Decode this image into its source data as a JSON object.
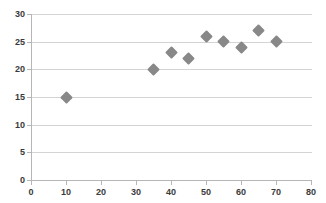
{
  "chart_data": {
    "type": "scatter",
    "title": "",
    "xlabel": "",
    "ylabel": "",
    "xlim": [
      0,
      80
    ],
    "ylim": [
      0,
      30
    ],
    "xticks": [
      0,
      10,
      20,
      30,
      40,
      50,
      60,
      70,
      80
    ],
    "yticks": [
      0,
      5,
      10,
      15,
      20,
      25,
      30
    ],
    "grid": "horizontal",
    "legend": "none",
    "marker": {
      "shape": "diamond",
      "color": "#888888",
      "size": 9
    },
    "series": [
      {
        "name": "Series1",
        "points": [
          {
            "x": 10,
            "y": 15
          },
          {
            "x": 35,
            "y": 20
          },
          {
            "x": 40,
            "y": 23
          },
          {
            "x": 45,
            "y": 22
          },
          {
            "x": 50,
            "y": 26
          },
          {
            "x": 55,
            "y": 25
          },
          {
            "x": 60,
            "y": 24
          },
          {
            "x": 65,
            "y": 27
          },
          {
            "x": 70,
            "y": 25
          }
        ]
      }
    ]
  }
}
